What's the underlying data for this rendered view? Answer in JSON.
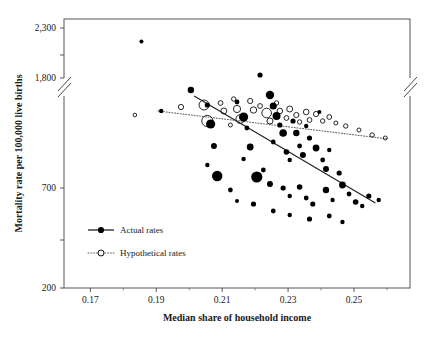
{
  "chart_data": {
    "type": "scatter",
    "title": "",
    "xlabel": "Median share of household income",
    "ylabel": "Mortality rate per 100,000 live births",
    "xlim": [
      0.162,
      0.267
    ],
    "ylim": [
      200,
      2400
    ],
    "xticks": [
      0.17,
      0.19,
      0.21,
      0.23,
      0.25
    ],
    "xticklabels": [
      "0.17",
      "0.19",
      "0.21",
      "0.23",
      "0.25"
    ],
    "yticks": [
      200,
      450,
      700,
      1800,
      2050,
      2300
    ],
    "yticklabels": [
      "200",
      "",
      "700",
      "1,800",
      "",
      "2,300"
    ],
    "y_axis_break": true,
    "y_axis_break_between": [
      760,
      1800
    ],
    "grid": false,
    "legend_position": "lower-left-inside",
    "series": [
      {
        "name": "Actual rates",
        "marker": "filled-circle",
        "line_style": "solid",
        "color": "#000000",
        "trendline": {
          "x0": 0.2015,
          "y0": 1160,
          "x1": 0.2565,
          "y1": 625
        },
        "points": [
          {
            "x": 0.1855,
            "y": 2165,
            "size": 2.0
          },
          {
            "x": 0.1915,
            "y": 1085,
            "size": 2.2
          },
          {
            "x": 0.2005,
            "y": 1190,
            "size": 3.2
          },
          {
            "x": 0.2055,
            "y": 1115,
            "size": 2.6
          },
          {
            "x": 0.2065,
            "y": 1020,
            "size": 4.6
          },
          {
            "x": 0.2075,
            "y": 910,
            "size": 3.0
          },
          {
            "x": 0.2055,
            "y": 815,
            "size": 2.2
          },
          {
            "x": 0.2085,
            "y": 760,
            "size": 5.2
          },
          {
            "x": 0.2145,
            "y": 1130,
            "size": 2.4
          },
          {
            "x": 0.2165,
            "y": 1055,
            "size": 4.6
          },
          {
            "x": 0.2175,
            "y": 1000,
            "size": 2.4
          },
          {
            "x": 0.2185,
            "y": 905,
            "size": 3.4
          },
          {
            "x": 0.2165,
            "y": 845,
            "size": 2.2
          },
          {
            "x": 0.2205,
            "y": 755,
            "size": 5.6
          },
          {
            "x": 0.2215,
            "y": 1265,
            "size": 2.6
          },
          {
            "x": 0.2245,
            "y": 1165,
            "size": 4.2
          },
          {
            "x": 0.2255,
            "y": 1110,
            "size": 3.6
          },
          {
            "x": 0.2265,
            "y": 1060,
            "size": 4.0
          },
          {
            "x": 0.2275,
            "y": 1015,
            "size": 2.6
          },
          {
            "x": 0.2285,
            "y": 975,
            "size": 3.8
          },
          {
            "x": 0.2255,
            "y": 930,
            "size": 2.4
          },
          {
            "x": 0.2295,
            "y": 880,
            "size": 2.8
          },
          {
            "x": 0.2305,
            "y": 840,
            "size": 2.2
          },
          {
            "x": 0.2315,
            "y": 1035,
            "size": 2.6
          },
          {
            "x": 0.2325,
            "y": 975,
            "size": 3.2
          },
          {
            "x": 0.2335,
            "y": 910,
            "size": 2.4
          },
          {
            "x": 0.2345,
            "y": 865,
            "size": 3.0
          },
          {
            "x": 0.2355,
            "y": 1010,
            "size": 2.2
          },
          {
            "x": 0.2365,
            "y": 950,
            "size": 2.6
          },
          {
            "x": 0.2385,
            "y": 900,
            "size": 3.4
          },
          {
            "x": 0.2395,
            "y": 1080,
            "size": 2.0
          },
          {
            "x": 0.2405,
            "y": 840,
            "size": 2.4
          },
          {
            "x": 0.2415,
            "y": 795,
            "size": 3.0
          },
          {
            "x": 0.2425,
            "y": 890,
            "size": 2.2
          },
          {
            "x": 0.2225,
            "y": 790,
            "size": 2.4
          },
          {
            "x": 0.2245,
            "y": 720,
            "size": 3.0
          },
          {
            "x": 0.2285,
            "y": 700,
            "size": 2.6
          },
          {
            "x": 0.2305,
            "y": 660,
            "size": 2.2
          },
          {
            "x": 0.2335,
            "y": 705,
            "size": 2.8
          },
          {
            "x": 0.2355,
            "y": 650,
            "size": 2.4
          },
          {
            "x": 0.2375,
            "y": 620,
            "size": 2.6
          },
          {
            "x": 0.2415,
            "y": 690,
            "size": 3.2
          },
          {
            "x": 0.2435,
            "y": 640,
            "size": 2.2
          },
          {
            "x": 0.2455,
            "y": 775,
            "size": 2.6
          },
          {
            "x": 0.2465,
            "y": 715,
            "size": 3.4
          },
          {
            "x": 0.2485,
            "y": 670,
            "size": 2.4
          },
          {
            "x": 0.2505,
            "y": 630,
            "size": 2.8
          },
          {
            "x": 0.2525,
            "y": 610,
            "size": 2.2
          },
          {
            "x": 0.2545,
            "y": 660,
            "size": 2.6
          },
          {
            "x": 0.2575,
            "y": 640,
            "size": 2.2
          },
          {
            "x": 0.2125,
            "y": 690,
            "size": 2.4
          },
          {
            "x": 0.2145,
            "y": 635,
            "size": 2.0
          },
          {
            "x": 0.2195,
            "y": 620,
            "size": 2.6
          },
          {
            "x": 0.2255,
            "y": 585,
            "size": 2.4
          },
          {
            "x": 0.2305,
            "y": 565,
            "size": 2.2
          },
          {
            "x": 0.2365,
            "y": 545,
            "size": 2.6
          },
          {
            "x": 0.2425,
            "y": 560,
            "size": 2.4
          },
          {
            "x": 0.2465,
            "y": 530,
            "size": 2.2
          }
        ]
      },
      {
        "name": "Hypothetical rates",
        "marker": "open-circle",
        "line_style": "dotted",
        "color": "#000000",
        "trendline": {
          "x0": 0.1905,
          "y0": 1085,
          "x1": 0.2605,
          "y1": 945
        },
        "points": [
          {
            "x": 0.1975,
            "y": 1105,
            "size": 2.6
          },
          {
            "x": 0.2045,
            "y": 1115,
            "size": 5.0
          },
          {
            "x": 0.2055,
            "y": 1035,
            "size": 5.6
          },
          {
            "x": 0.2095,
            "y": 1125,
            "size": 2.4
          },
          {
            "x": 0.2105,
            "y": 1085,
            "size": 3.0
          },
          {
            "x": 0.2135,
            "y": 1145,
            "size": 2.2
          },
          {
            "x": 0.2145,
            "y": 1095,
            "size": 3.6
          },
          {
            "x": 0.2155,
            "y": 1045,
            "size": 4.4
          },
          {
            "x": 0.2185,
            "y": 1135,
            "size": 2.6
          },
          {
            "x": 0.2195,
            "y": 1090,
            "size": 3.2
          },
          {
            "x": 0.2215,
            "y": 1110,
            "size": 2.4
          },
          {
            "x": 0.2235,
            "y": 1075,
            "size": 4.8
          },
          {
            "x": 0.2245,
            "y": 1035,
            "size": 3.0
          },
          {
            "x": 0.2265,
            "y": 1125,
            "size": 2.2
          },
          {
            "x": 0.2275,
            "y": 1085,
            "size": 2.8
          },
          {
            "x": 0.2295,
            "y": 1050,
            "size": 2.4
          },
          {
            "x": 0.2305,
            "y": 1095,
            "size": 3.0
          },
          {
            "x": 0.2325,
            "y": 1065,
            "size": 2.6
          },
          {
            "x": 0.2335,
            "y": 1030,
            "size": 2.2
          },
          {
            "x": 0.2355,
            "y": 1080,
            "size": 2.8
          },
          {
            "x": 0.2365,
            "y": 1040,
            "size": 2.4
          },
          {
            "x": 0.2385,
            "y": 1070,
            "size": 2.6
          },
          {
            "x": 0.2405,
            "y": 1035,
            "size": 2.2
          },
          {
            "x": 0.2425,
            "y": 1055,
            "size": 2.4
          },
          {
            "x": 0.2445,
            "y": 1025,
            "size": 2.0
          },
          {
            "x": 0.2475,
            "y": 1010,
            "size": 2.2
          },
          {
            "x": 0.2515,
            "y": 990,
            "size": 2.0
          },
          {
            "x": 0.2555,
            "y": 965,
            "size": 2.2
          },
          {
            "x": 0.2595,
            "y": 950,
            "size": 2.0
          },
          {
            "x": 0.1835,
            "y": 1065,
            "size": 1.8
          },
          {
            "x": 0.2125,
            "y": 1015,
            "size": 2.0
          }
        ]
      }
    ]
  },
  "legend": {
    "items": [
      {
        "label": "Actual rates",
        "marker": "filled-circle",
        "line": "solid"
      },
      {
        "label": "Hypothetical rates",
        "marker": "open-circle",
        "line": "dotted"
      }
    ]
  }
}
